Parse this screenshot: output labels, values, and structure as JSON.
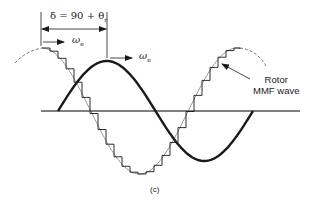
{
  "figure": {
    "caption": "(c)",
    "delta_label": {
      "main": "δ = 90 + θ",
      "subscript": "r"
    },
    "omega_labels": [
      {
        "symbol": "ω",
        "subscript": "e"
      },
      {
        "symbol": "ω",
        "subscript": "e"
      }
    ],
    "rotor_label": {
      "line1": "Rotor",
      "line2": "MMF wave"
    }
  },
  "colors": {
    "line": "#1a1a1a",
    "axis": "#555555",
    "background": "#ffffff"
  }
}
